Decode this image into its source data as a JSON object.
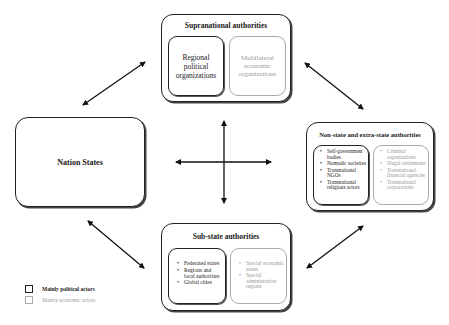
{
  "diagram": {
    "type": "relationship-diagram",
    "nodes": {
      "supranational": {
        "title": "Supranational authorities",
        "political": {
          "label": "Regional political organizations"
        },
        "economic": {
          "label": "Multilateral economic organizations"
        }
      },
      "nation_states": {
        "title": "Nation States"
      },
      "non_state": {
        "title": "Non-state and extra-state authorities",
        "political": [
          "Self-government bodies",
          "Nomadic societies",
          "Transnational NGOs",
          "Transnational religious actors"
        ],
        "economic": [
          "Criminal organizations",
          "Illegal settlements",
          "Transnational financial agencies",
          "Transnational corporations"
        ]
      },
      "sub_state": {
        "title": "Sub-state authorities",
        "political": [
          "Federated states",
          "Regions and local authorities",
          "Global cities"
        ],
        "economic": [
          "Special economic zones",
          "Special administrative regions"
        ]
      }
    },
    "edges": [
      {
        "from": "nation_states",
        "to": "supranational",
        "type": "bidirectional"
      },
      {
        "from": "supranational",
        "to": "non_state",
        "type": "bidirectional"
      },
      {
        "from": "nation_states",
        "to": "sub_state",
        "type": "bidirectional"
      },
      {
        "from": "sub_state",
        "to": "non_state",
        "type": "bidirectional"
      },
      {
        "from": "center",
        "to": "all",
        "type": "cross-bidirectional"
      }
    ],
    "legend": [
      {
        "label": "Mainly political actors",
        "color": "#222222"
      },
      {
        "label": "Mainly economic actors",
        "color": "#aaaaaa"
      }
    ]
  }
}
